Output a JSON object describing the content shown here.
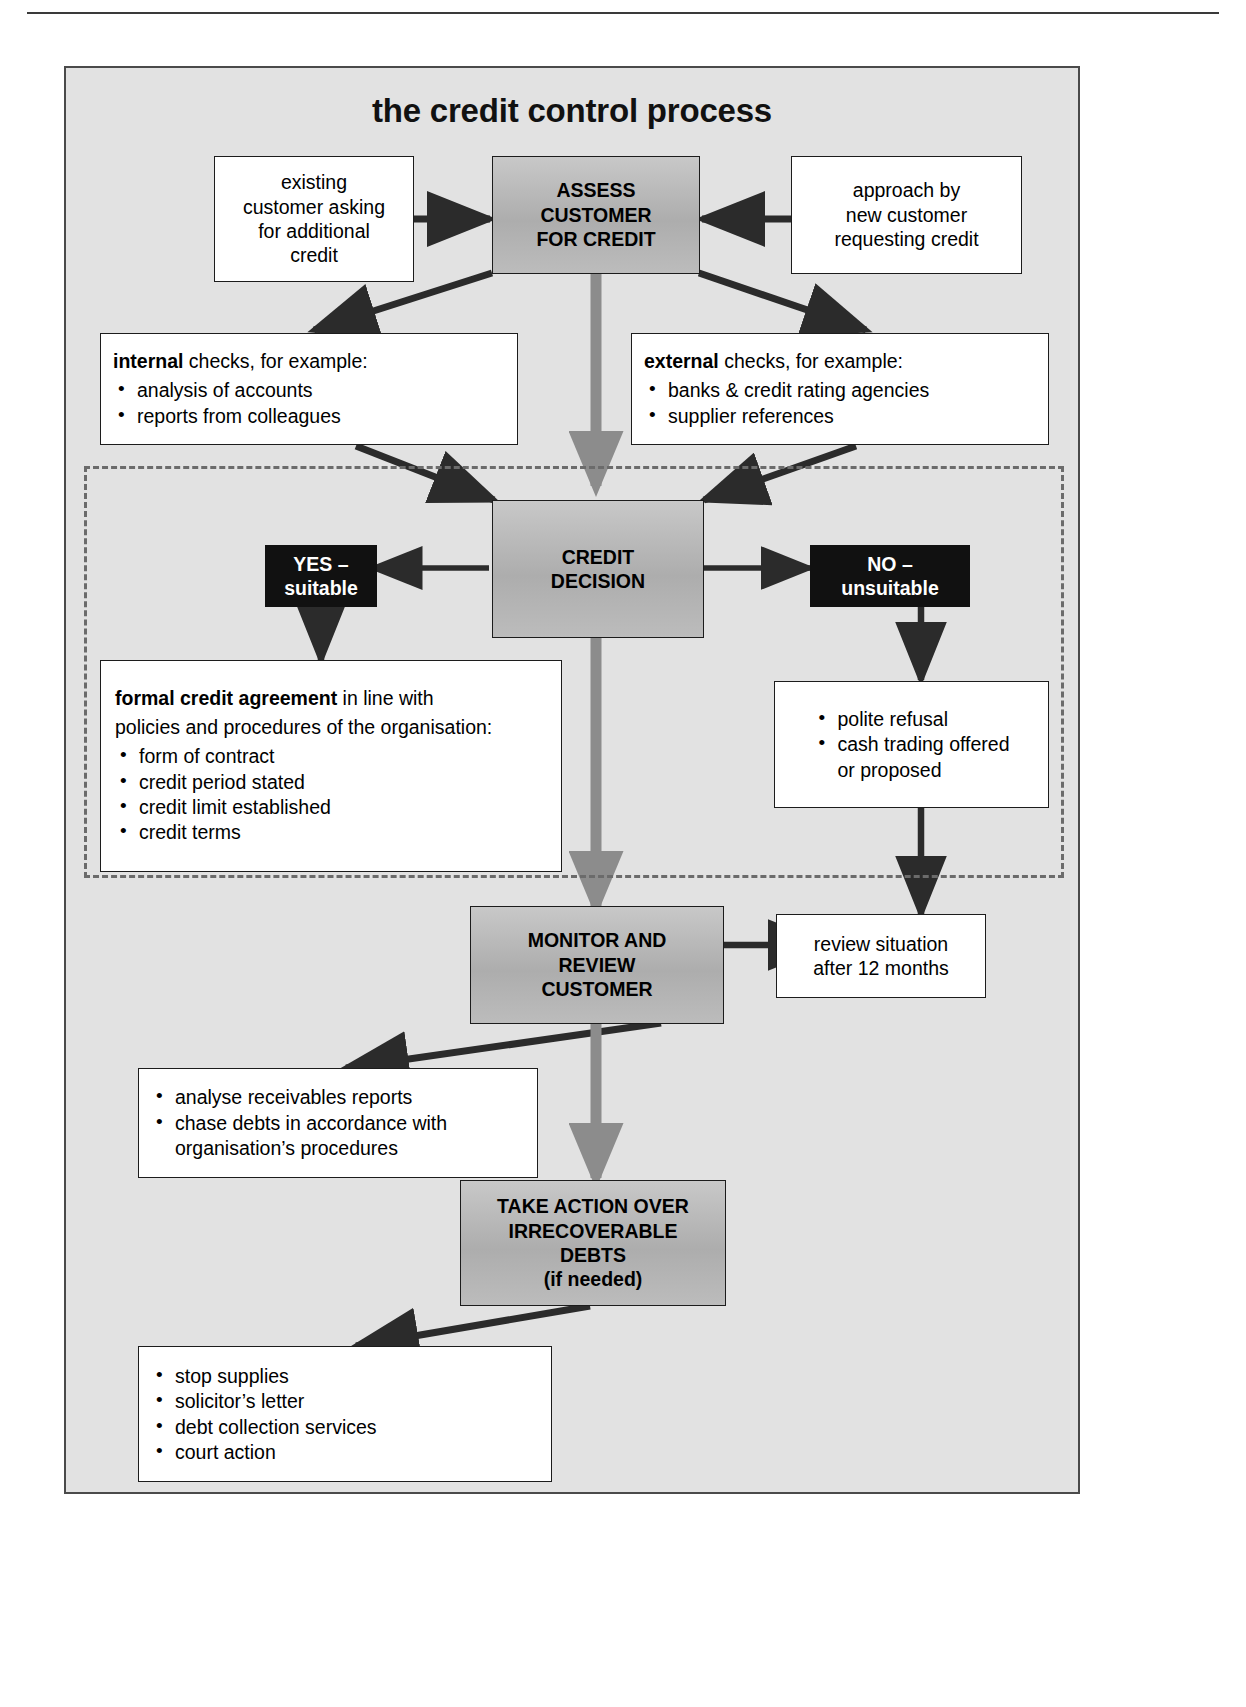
{
  "figure": {
    "title": "the credit control process"
  },
  "nodes": {
    "existing_customer": {
      "lines": [
        "existing",
        "customer asking",
        "for additional",
        "credit"
      ]
    },
    "assess_customer": {
      "lines": [
        "ASSESS",
        "CUSTOMER",
        "FOR CREDIT"
      ]
    },
    "new_customer": {
      "lines": [
        "approach by",
        "new customer",
        "requesting credit"
      ]
    },
    "internal_checks": {
      "lead_bold": "internal",
      "lead_rest": " checks, for example:",
      "bullets": [
        "analysis of accounts",
        "reports from colleagues"
      ]
    },
    "external_checks": {
      "lead_bold": "external",
      "lead_rest": " checks, for example:",
      "bullets": [
        "banks & credit rating agencies",
        "supplier references"
      ]
    },
    "credit_decision": {
      "lines": [
        "CREDIT",
        "DECISION"
      ]
    },
    "yes_suitable": {
      "lines": [
        "YES –",
        "suitable"
      ]
    },
    "no_unsuitable": {
      "lines": [
        "NO –",
        "unsuitable"
      ]
    },
    "formal_agreement": {
      "lead_bold": "formal credit agreement",
      "lead_rest": " in line with",
      "lead_line2": "policies and procedures of the organisation:",
      "bullets": [
        "form of contract",
        "credit period stated",
        "credit limit established",
        "credit terms"
      ]
    },
    "refusal": {
      "bullets": [
        "polite refusal",
        "cash trading offered"
      ],
      "continuation": "or proposed"
    },
    "monitor_review": {
      "lines": [
        "MONITOR AND",
        "REVIEW",
        "CUSTOMER"
      ]
    },
    "review_situation": {
      "lines": [
        "review situation",
        "after 12 months"
      ]
    },
    "receivables": {
      "bullets": [
        "analyse receivables reports",
        "chase debts in accordance with"
      ],
      "continuation": "organisation’s procedures"
    },
    "take_action": {
      "lines": [
        "TAKE ACTION OVER",
        "IRRECOVERABLE",
        "DEBTS",
        "(if needed)"
      ]
    },
    "recovery_actions": {
      "bullets": [
        "stop supplies",
        "solicitor’s letter",
        "debt collection services",
        "court action"
      ]
    }
  },
  "colors": {
    "panel_background": "#e2e2e2",
    "process_box_fill": "#b4b4b4",
    "decision_outcome_fill": "#111111",
    "decision_outcome_text": "#ffffff",
    "detail_box_fill": "#ffffff",
    "connector_dark": "#2b2b2b",
    "connector_grey": "#8c8c8c",
    "dashed_region_border": "#6b6b6b"
  }
}
